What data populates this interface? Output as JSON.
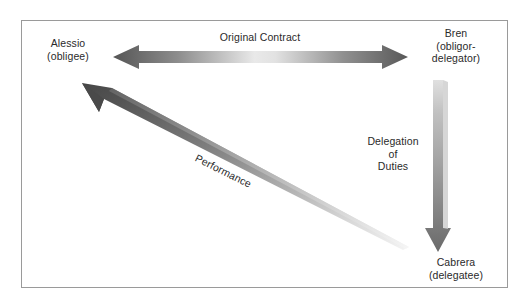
{
  "figure": {
    "background_color": "#ffffff",
    "border_color": "#9a9a9a"
  },
  "nodes": [
    {
      "id": "alessio",
      "name": "Alessio",
      "role": "(obligee)",
      "position": "left"
    },
    {
      "id": "bren",
      "name": "Bren",
      "role_line1": "(obligor-",
      "role_line2": "delegator)",
      "position": "top-right"
    },
    {
      "id": "cabrera",
      "name": "Cabrera",
      "role": "(delegatee)",
      "position": "bottom-right"
    }
  ],
  "arrows": [
    {
      "id": "original-contract",
      "label": "Original Contract",
      "from": "alessio",
      "to": "bren",
      "style": "double-headed",
      "orientation": "horizontal",
      "color_dark": "#5a5a5a",
      "color_light": "#e8e8e8"
    },
    {
      "id": "delegation-of-duties",
      "label_line1": "Delegation",
      "label_line2": "of",
      "label_line3": "Duties",
      "from": "bren",
      "to": "cabrera",
      "style": "single-headed",
      "orientation": "vertical",
      "color_dark": "#676767",
      "color_light": "#dcdcdc"
    },
    {
      "id": "performance",
      "label": "Performance",
      "from": "cabrera",
      "to": "alessio",
      "style": "single-headed",
      "orientation": "diagonal",
      "color_dark": "#4a4a4a",
      "color_light": "#f2f2f2"
    }
  ]
}
